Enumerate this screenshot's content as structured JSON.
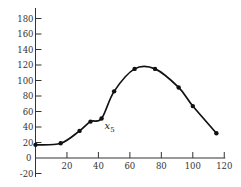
{
  "chart_data": {
    "type": "line",
    "title": "",
    "xlabel": "",
    "ylabel": "",
    "xlim": [
      0,
      120
    ],
    "ylim": [
      -20,
      190
    ],
    "grid": false,
    "legend": null,
    "x_ticks": [
      20,
      40,
      60,
      80,
      100,
      120
    ],
    "y_ticks": [
      -20,
      0,
      20,
      40,
      60,
      80,
      100,
      120,
      140,
      160,
      180
    ],
    "series": [
      {
        "name": "curve",
        "smooth": true,
        "markers": true,
        "points": [
          {
            "x": 0,
            "y": 17
          },
          {
            "x": 16,
            "y": 19
          },
          {
            "x": 28,
            "y": 35
          },
          {
            "x": 35,
            "y": 47
          },
          {
            "x": 42,
            "y": 51
          },
          {
            "x": 50,
            "y": 86
          },
          {
            "x": 63,
            "y": 115
          },
          {
            "x": 76,
            "y": 115
          },
          {
            "x": 91,
            "y": 91
          },
          {
            "x": 100,
            "y": 67
          },
          {
            "x": 115,
            "y": 32
          }
        ]
      }
    ],
    "annotations": [
      {
        "text": "x",
        "subscript": "5",
        "x": 42,
        "y": 51
      }
    ]
  },
  "annotation": {
    "main": "x",
    "sub": "5"
  }
}
